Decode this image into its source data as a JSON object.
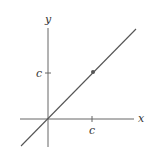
{
  "diagram": {
    "type": "coordinate-graph",
    "axes": {
      "x_label": "x",
      "y_label": "y"
    },
    "ticks": {
      "x_tick_label": "c",
      "y_tick_label": "c"
    },
    "line": {
      "description": "y = x, passing through origin",
      "color": "#555555"
    },
    "point": {
      "description": "point (c, c) on the line",
      "color": "#555555"
    }
  }
}
